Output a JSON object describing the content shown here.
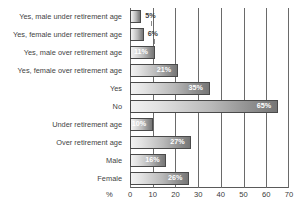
{
  "chart_data": {
    "type": "bar",
    "orientation": "horizontal",
    "title": "",
    "xlabel": "%",
    "ylabel": "",
    "xlim": [
      0,
      70
    ],
    "xticks": [
      0,
      10,
      20,
      30,
      40,
      50,
      60,
      70
    ],
    "grid": true,
    "legend": false,
    "categories": [
      "Yes, male under retirement age",
      "Yes, female under retirement age",
      "Yes, male over retirement age",
      "Yes, female over retirement age",
      "Yes",
      "No",
      "Under retirement age",
      "Over retirement age",
      "Male",
      "Female"
    ],
    "values": [
      5,
      6,
      11,
      21,
      35,
      65,
      10,
      27,
      16,
      26
    ],
    "value_labels": [
      "5%",
      "6%",
      "11%",
      "21%",
      "35%",
      "65%",
      "10%",
      "27%",
      "16%",
      "26%"
    ],
    "label_placement": [
      "outside",
      "outside",
      "inside",
      "inside",
      "inside",
      "inside",
      "inside",
      "inside",
      "inside",
      "inside"
    ]
  },
  "axis": {
    "unit_label": "%",
    "tick_labels": [
      "0",
      "10",
      "20",
      "30",
      "40",
      "50",
      "60",
      "70"
    ]
  },
  "colors": {
    "bar_light": "#f2f2f2",
    "bar_dark": "#767676",
    "bar_border": "#4a4a4a",
    "gridline": "#6a6a6a",
    "text": "#3a3a3a",
    "value_text_inside": "#ffffff",
    "background": "#ffffff"
  }
}
